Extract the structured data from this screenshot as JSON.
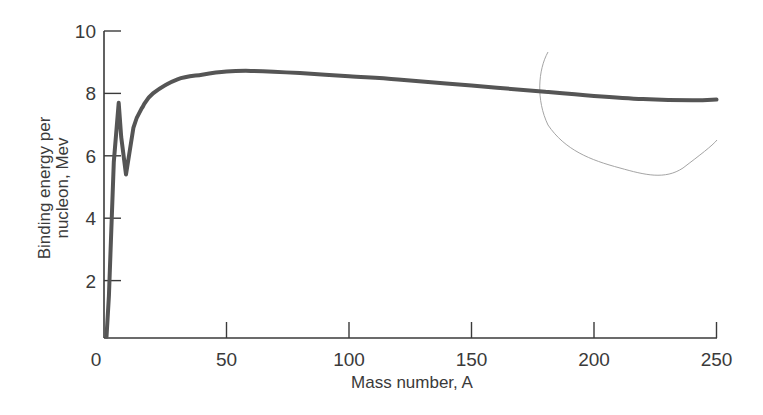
{
  "chart_data": {
    "type": "line",
    "title": "",
    "xlabel": "Mass number, A",
    "ylabel_line1": "Binding energy per",
    "ylabel_line2": "nucleon, Mev",
    "ylabel": "Binding energy per nucleon, Mev",
    "xlim": [
      0,
      250
    ],
    "ylim": [
      0,
      10
    ],
    "x_ticks": [
      0,
      50,
      100,
      150,
      200,
      250
    ],
    "x_tick_labels": [
      "0",
      "50",
      "100",
      "150",
      "200",
      "250"
    ],
    "y_ticks": [
      2,
      4,
      6,
      8,
      10
    ],
    "y_tick_labels": [
      "2",
      "4",
      "6",
      "8",
      "10"
    ],
    "grid": false,
    "legend": null,
    "series": [
      {
        "name": "Binding energy per nucleon",
        "x": [
          1,
          2,
          4,
          6,
          7,
          9,
          12,
          16,
          20,
          30,
          40,
          50,
          60,
          80,
          100,
          120,
          150,
          180,
          200,
          220,
          240,
          250
        ],
        "y": [
          0.2,
          1.5,
          5.8,
          7.7,
          6.6,
          5.4,
          6.9,
          7.6,
          8.0,
          8.45,
          8.6,
          8.7,
          8.72,
          8.65,
          8.55,
          8.45,
          8.25,
          8.05,
          7.92,
          7.82,
          7.78,
          7.8
        ]
      }
    ],
    "annotations": [
      {
        "type": "stray-pencil-mark",
        "description": "thin light curve from about A=178,y=9.3 down to A=235,y=5.6 then up toward A=250,y=6.4"
      }
    ]
  }
}
